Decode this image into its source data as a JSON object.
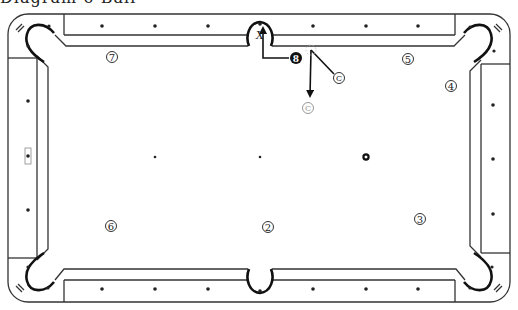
{
  "header": {
    "cutoff_title": "Diagram 6-Ball"
  },
  "table": {
    "outer_color": "#333333",
    "pocket_color": "#111111",
    "pockets": [
      {
        "name": "top-left",
        "x": 40,
        "y": 40
      },
      {
        "name": "top-middle",
        "x": 260,
        "y": 36
      },
      {
        "name": "top-right",
        "x": 480,
        "y": 40
      },
      {
        "name": "bottom-left",
        "x": 40,
        "y": 272
      },
      {
        "name": "bottom-middle",
        "x": 260,
        "y": 280
      },
      {
        "name": "bottom-right",
        "x": 480,
        "y": 272
      }
    ],
    "target_pocket_label": "X",
    "diamonds": {
      "top": [
        102,
        155,
        208,
        313,
        366,
        418
      ],
      "bottom": [
        102,
        155,
        208,
        313,
        366,
        418
      ],
      "left": [
        101,
        156,
        210
      ],
      "right": [
        105,
        159,
        214
      ]
    },
    "spots": [
      {
        "name": "foot-spot",
        "x": 155,
        "y": 157
      },
      {
        "name": "center-spot",
        "x": 260,
        "y": 157
      },
      {
        "name": "head-spot",
        "x": 366,
        "y": 157,
        "large": true
      }
    ]
  },
  "balls": [
    {
      "label": "7",
      "x": 112,
      "y": 57
    },
    {
      "label": "5",
      "x": 408,
      "y": 59
    },
    {
      "label": "4",
      "x": 451,
      "y": 86
    },
    {
      "label": "6",
      "x": 111,
      "y": 226
    },
    {
      "label": "2",
      "x": 268,
      "y": 227
    },
    {
      "label": "3",
      "x": 420,
      "y": 219
    }
  ],
  "object_ball": {
    "label": "8",
    "x": 296,
    "y": 58,
    "color": "#111111"
  },
  "cue_ball": {
    "label": "C",
    "x": 339,
    "y": 78
  },
  "cue_ghost": {
    "label": "C",
    "x": 308,
    "y": 108,
    "color": "#999999"
  },
  "shot_lines": [
    {
      "name": "object-ball-path",
      "points": "289,58 263,58 263,28"
    },
    {
      "name": "cue-path-to-contact",
      "points": "334,74 311,50"
    },
    {
      "name": "cue-path-after-contact",
      "points": "311,50 310,96"
    }
  ]
}
